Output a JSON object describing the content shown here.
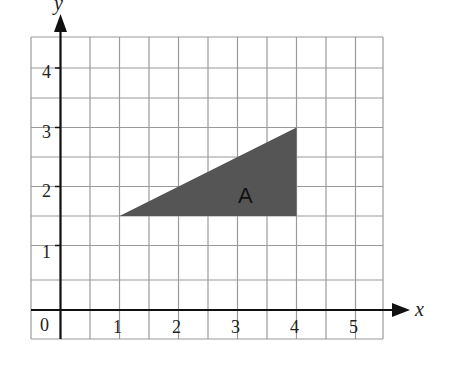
{
  "diagram": {
    "type": "coordinate-grid",
    "x_axis_label": "x",
    "y_axis_label": "y",
    "origin_label": "0",
    "x_ticks": [
      "1",
      "2",
      "3",
      "4",
      "5"
    ],
    "y_ticks": [
      "1",
      "2",
      "3",
      "4"
    ],
    "grid_step": 0.5,
    "x_range": [
      -0.5,
      5.5
    ],
    "y_range": [
      -0.5,
      4.6
    ],
    "shape": {
      "label": "A",
      "type": "triangle",
      "vertices": [
        [
          1,
          1.5
        ],
        [
          4,
          1.5
        ],
        [
          4,
          3
        ]
      ],
      "fill": "#555555"
    },
    "colors": {
      "grid": "#999999",
      "axis": "#111111",
      "shape": "#555555"
    }
  }
}
